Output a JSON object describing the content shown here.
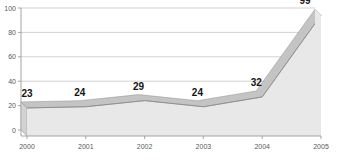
{
  "chart_data": {
    "type": "area",
    "title": "",
    "subtitle": "",
    "xlabel": "",
    "ylabel": "",
    "categories": [
      "2000",
      "2001",
      "2002",
      "2003",
      "2004",
      "2005"
    ],
    "values": [
      23,
      24,
      29,
      24,
      32,
      99
    ],
    "data_labels": [
      "23",
      "24",
      "29",
      "24",
      "32",
      "99"
    ],
    "ylim": [
      0,
      100
    ],
    "yticks": [
      0,
      20,
      40,
      60,
      80,
      100
    ],
    "ytick_labels": [
      "0",
      "20",
      "40",
      "60",
      "80",
      "100"
    ],
    "xtick_labels": [
      "2000",
      "2001",
      "2002",
      "2003",
      "2004",
      "2005"
    ],
    "grid": true,
    "grid_axis": "y",
    "legend": false,
    "legend_position": "none",
    "style": "3d-area",
    "colors": {
      "background": "#ffffff",
      "area_fill": "#e8e8e8",
      "ribbon_top": "#c4c4c4",
      "ribbon_edge": "#9a9a9a",
      "side_face": "#d2d2d2",
      "line": "#8c8c8c",
      "gridline": "#bfbfbf",
      "axis": "#9b9b9b",
      "tick_label": "#5a5a5a",
      "value_label": "#141414"
    }
  }
}
